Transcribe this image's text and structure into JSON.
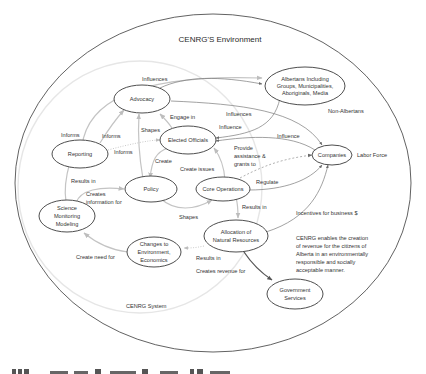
{
  "diagram": {
    "title": "CENRG'S Environment",
    "system_label": "CENRG System",
    "outer_labels": {
      "non_albertans": "Non-Albertans",
      "labor_force": "Labor Force",
      "incentives": "Incentives for business $"
    },
    "note": {
      "line1": "CENRG enables the creation",
      "line2": "of revenue for the citizens of",
      "line3": "Alberta in an environmentally",
      "line4": "responsible and socially",
      "line5": "acceptable manner."
    },
    "nodes": {
      "advocacy": {
        "line1": "Advocacy"
      },
      "albertans": {
        "line1": "Albertans Including",
        "line2": "Groups, Municipalities,",
        "line3": "Aboriginals, Media"
      },
      "elected": {
        "line1": "Elected Officials"
      },
      "reporting": {
        "line1": "Reporting"
      },
      "companies": {
        "line1": "Companies"
      },
      "policy": {
        "line1": "Policy"
      },
      "core": {
        "line1": "Core Operations"
      },
      "science": {
        "line1": "Science",
        "line2": "Monitoring",
        "line3": "Modeling"
      },
      "allocation": {
        "line1": "Allocation of",
        "line2": "Natural Resources"
      },
      "changes": {
        "line1": "Changes to",
        "line2": "Environment,",
        "line3": "Economics"
      },
      "government": {
        "line1": "Government",
        "line2": "Services"
      }
    },
    "edges": {
      "influences_top": "Influences",
      "engage_in": "Engage in",
      "influences_mid": "Influences",
      "influence_albertans": "Influence",
      "influence_companies": "Influence",
      "informs_left": "Informs",
      "informs_mid": "Informs",
      "informs_right": "Informs",
      "shapes_top": "Shapes",
      "create": "Create",
      "create_issues": "Create issues",
      "provide_line1": "Provide",
      "provide_line2": "assistance &",
      "provide_line3": "grants to",
      "regulate": "Regulate",
      "results_in_reporting": "Results in",
      "creates_info_line1": "Creates",
      "creates_info_line2": "information for",
      "shapes_bottom": "Shapes",
      "results_in_core": "Results in",
      "create_need_for": "Create need for",
      "results_in_alloc": "Results in",
      "creates_revenue_for": "Creates revenue for"
    }
  }
}
